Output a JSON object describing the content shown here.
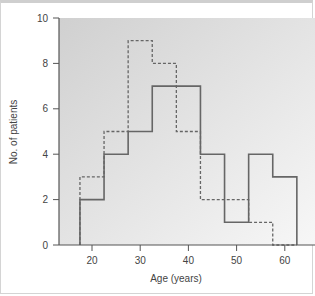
{
  "chart_data": {
    "type": "histogram",
    "title": "",
    "xlabel": "Age (years)",
    "ylabel": "No. of patients",
    "xlim": [
      13,
      66
    ],
    "ylim": [
      0,
      10
    ],
    "xticks": [
      20,
      30,
      40,
      50,
      60
    ],
    "yticks": [
      0,
      2,
      4,
      6,
      8,
      10
    ],
    "grid": false,
    "legend": null,
    "bin_edges": [
      17.5,
      22.5,
      27.5,
      32.5,
      37.5,
      42.5,
      47.5,
      52.5,
      57.5,
      62.5
    ],
    "bin_centers": [
      20,
      25,
      30,
      35,
      40,
      45,
      50,
      55,
      60
    ],
    "series": [
      {
        "name": "solid",
        "style": "solid",
        "color": "#666666",
        "values": [
          2,
          4,
          5,
          7,
          7,
          4,
          1,
          4,
          3
        ]
      },
      {
        "name": "dashed",
        "style": "dashed",
        "color": "#666666",
        "values": [
          3,
          5,
          9,
          8,
          5,
          2,
          2,
          1,
          0
        ]
      }
    ]
  },
  "labels": {
    "xlabel": "Age (years)",
    "ylabel": "No. of patients",
    "yticks": [
      "0",
      "2",
      "4",
      "6",
      "8",
      "10"
    ],
    "xticks": [
      "20",
      "30",
      "40",
      "50",
      "60"
    ]
  }
}
